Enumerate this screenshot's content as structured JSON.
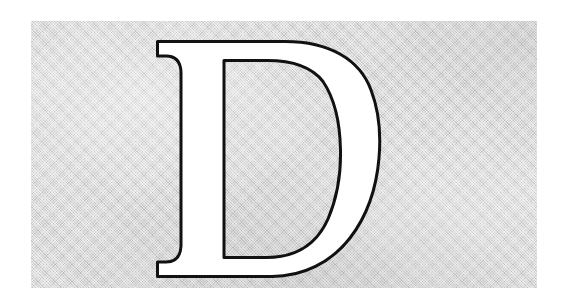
{
  "image": {
    "kind": "decorative-drop-cap-illustration",
    "letter": "D",
    "letter_case": "uppercase",
    "letter_style": "serif-outline",
    "alt_text": "Large outlined serif capital letter D on a textured gray panel",
    "canvas": {
      "width": 563,
      "height": 308,
      "background_color": "#ffffff"
    },
    "panel": {
      "name": "textured-gray-panel",
      "x": 31,
      "y": 21,
      "width": 506,
      "height": 267,
      "fill_color": "#cdcdcd",
      "texture": "fine diagonal crosshatch",
      "border": "none"
    },
    "letterform": {
      "name": "capital-d",
      "glyph": "D",
      "fill_color": "#ffffff",
      "outline_color": "#111111",
      "outline_width_px": 3,
      "counter_fill": "panel-texture",
      "bbox": {
        "x": 157,
        "y": 41,
        "width": 223,
        "height": 236
      },
      "stem": {
        "x": 181,
        "width": 43
      },
      "bowl": {
        "right_edge_x": 380,
        "max_stroke_width": 47
      },
      "serifs": [
        "top-left-bracketed",
        "bottom-left-bracketed"
      ]
    }
  }
}
